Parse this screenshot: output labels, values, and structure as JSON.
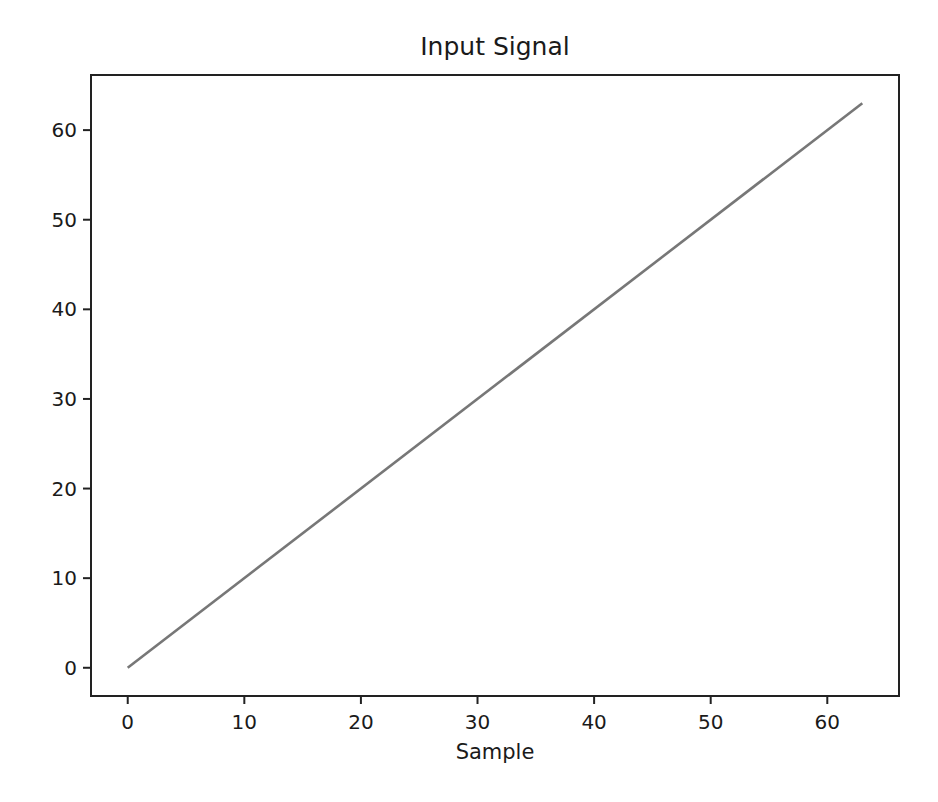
{
  "chart_data": {
    "type": "line",
    "title": "Input Signal",
    "xlabel": "Sample",
    "ylabel": "",
    "xlim": [
      -3.15,
      66.15
    ],
    "ylim": [
      -3.15,
      66.15
    ],
    "xticks": [
      0,
      10,
      20,
      30,
      40,
      50,
      60
    ],
    "yticks": [
      0,
      10,
      20,
      30,
      40,
      50,
      60
    ],
    "grid": false,
    "legend": null,
    "series": [
      {
        "name": "input",
        "color": "#777777",
        "x": [
          0,
          63
        ],
        "y": [
          0,
          63
        ],
        "description": "linear ramp y = x for samples 0..63"
      }
    ]
  },
  "plot_area": {
    "left": 91,
    "top": 75,
    "right": 899,
    "bottom": 696
  },
  "colors": {
    "line": "#777777",
    "axes": "#222222",
    "background": "#ffffff"
  }
}
